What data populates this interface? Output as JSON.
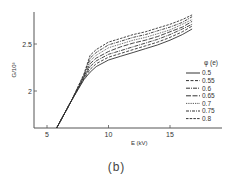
{
  "caption": "(b)",
  "chart_data": {
    "type": "line",
    "title": "",
    "xlabel": "E (kV)",
    "ylabel": "G/10^3",
    "xlim": [
      3.9,
      19.2
    ],
    "ylim": [
      1.61,
      2.84
    ],
    "xticks": [
      5,
      10,
      15
    ],
    "yticks": [
      2,
      2.5
    ],
    "grid": false,
    "legend_title": "φ (e)",
    "legend_position": "right-middle",
    "x": [
      5.8,
      7.0,
      8.0,
      8.5,
      9.0,
      10.0,
      11.0,
      12.0,
      13.0,
      14.0,
      15.0,
      16.0,
      16.8
    ],
    "series": [
      {
        "name": "0.5",
        "style": "solid",
        "values": [
          1.61,
          1.9,
          2.12,
          2.2,
          2.26,
          2.33,
          2.37,
          2.41,
          2.45,
          2.49,
          2.54,
          2.6,
          2.66
        ]
      },
      {
        "name": "0.55",
        "style": "dashed",
        "values": [
          1.61,
          1.9,
          2.13,
          2.23,
          2.29,
          2.36,
          2.4,
          2.44,
          2.48,
          2.52,
          2.57,
          2.63,
          2.69
        ]
      },
      {
        "name": "0.6",
        "style": "dash-dot",
        "values": [
          1.61,
          1.9,
          2.14,
          2.26,
          2.32,
          2.39,
          2.43,
          2.47,
          2.51,
          2.55,
          2.6,
          2.66,
          2.71
        ]
      },
      {
        "name": "0.65",
        "style": "longdash",
        "values": [
          1.61,
          1.9,
          2.15,
          2.29,
          2.35,
          2.42,
          2.47,
          2.51,
          2.54,
          2.58,
          2.63,
          2.68,
          2.74
        ]
      },
      {
        "name": "0.7",
        "style": "dotted",
        "values": [
          1.61,
          1.9,
          2.16,
          2.32,
          2.38,
          2.46,
          2.5,
          2.54,
          2.57,
          2.61,
          2.65,
          2.71,
          2.76
        ]
      },
      {
        "name": "0.75",
        "style": "dash-dot2",
        "values": [
          1.61,
          1.9,
          2.17,
          2.35,
          2.41,
          2.49,
          2.53,
          2.57,
          2.6,
          2.64,
          2.68,
          2.73,
          2.79
        ]
      },
      {
        "name": "0.8",
        "style": "dashed2",
        "values": [
          1.61,
          1.9,
          2.18,
          2.38,
          2.44,
          2.52,
          2.56,
          2.6,
          2.63,
          2.67,
          2.71,
          2.76,
          2.81
        ]
      }
    ]
  },
  "styles": {
    "line_color": "#333333",
    "axis_color": "#555555"
  }
}
